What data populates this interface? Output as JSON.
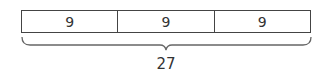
{
  "diagram": {
    "type": "tape-diagram",
    "segments": [
      {
        "label": "9"
      },
      {
        "label": "9"
      },
      {
        "label": "9"
      }
    ],
    "total": {
      "label": "27"
    },
    "colors": {
      "stroke": "#444444",
      "text": "#333333",
      "background": "#ffffff"
    }
  }
}
